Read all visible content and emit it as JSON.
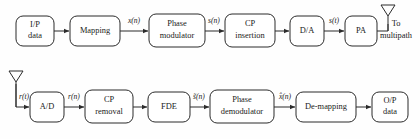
{
  "diagram": {
    "background_color": "#fefefe",
    "line_color": "#2b2b2b",
    "block_fill": "#ffffff",
    "transmitter_chain": [
      {
        "id": "ip-data",
        "line1": "I/P",
        "line2": "data",
        "x": 16,
        "y": 16,
        "w": 38,
        "h": 30
      },
      {
        "id": "mapping",
        "line1": "Mapping",
        "line2": "",
        "x": 70,
        "y": 16,
        "w": 50,
        "h": 30
      },
      {
        "id": "phase-modulator",
        "line1": "Phase",
        "line2": "modulator",
        "x": 149,
        "y": 14,
        "w": 56,
        "h": 33
      },
      {
        "id": "cp-insertion",
        "line1": "CP",
        "line2": "insertion",
        "x": 225,
        "y": 14,
        "w": 50,
        "h": 33
      },
      {
        "id": "da-converter",
        "line1": "D/A",
        "line2": "",
        "x": 290,
        "y": 16,
        "w": 34,
        "h": 30
      },
      {
        "id": "power-amplifier",
        "line1": "PA",
        "line2": "",
        "x": 345,
        "y": 16,
        "w": 32,
        "h": 30
      }
    ],
    "receiver_chain": [
      {
        "id": "ad-converter",
        "line1": "A/D",
        "line2": "",
        "x": 30,
        "y": 92,
        "w": 34,
        "h": 30
      },
      {
        "id": "cp-removal",
        "line1": "CP",
        "line2": "removal",
        "x": 85,
        "y": 90,
        "w": 48,
        "h": 33
      },
      {
        "id": "fde",
        "line1": "FDE",
        "line2": "",
        "x": 148,
        "y": 92,
        "w": 42,
        "h": 30
      },
      {
        "id": "phase-demodulator",
        "line1": "Phase",
        "line2": "demodulator",
        "x": 210,
        "y": 90,
        "w": 64,
        "h": 33
      },
      {
        "id": "de-mapping",
        "line1": "De-mapping",
        "line2": "",
        "x": 296,
        "y": 92,
        "w": 60,
        "h": 30
      },
      {
        "id": "op-data",
        "line1": "O/P",
        "line2": "data",
        "x": 372,
        "y": 92,
        "w": 36,
        "h": 30
      }
    ],
    "signal_labels": [
      {
        "id": "x-n",
        "text": "x(n)",
        "x": 134,
        "y": 17
      },
      {
        "id": "s-n",
        "text": "s(n)",
        "x": 214,
        "y": 17
      },
      {
        "id": "s-t",
        "text": "s(t)",
        "x": 334,
        "y": 17
      },
      {
        "id": "r-t",
        "text": "r(t)",
        "x": 22,
        "y": 93
      },
      {
        "id": "r-n",
        "text": "r(n)",
        "x": 74,
        "y": 93
      },
      {
        "id": "s-tilde-n",
        "text": "s̃(n)",
        "x": 199,
        "y": 93
      },
      {
        "id": "x-hat-n",
        "text": "x̂(n)",
        "x": 285,
        "y": 93
      }
    ],
    "annotations": [
      {
        "id": "to-multipath-line1",
        "text": "To",
        "x": 396,
        "y": 24
      },
      {
        "id": "to-multipath-line2",
        "text": "multipath",
        "x": 396,
        "y": 36
      }
    ],
    "antennas": [
      {
        "id": "tx-antenna",
        "tip_x": 388,
        "top_y": 4,
        "base_y": 32
      },
      {
        "id": "rx-antenna",
        "tip_x": 16,
        "top_y": 70,
        "base_y": 98
      }
    ]
  }
}
